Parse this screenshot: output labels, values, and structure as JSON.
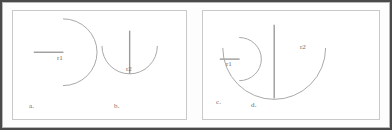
{
  "figure": {
    "panels": [
      {
        "id": "panel-left",
        "shapes": [
          {
            "key": "a",
            "caption": "a.",
            "radius_label": "r1",
            "orientation": "semicircle-opening-left",
            "radius_orientation": "horizontal",
            "size": "large"
          },
          {
            "key": "b",
            "caption": "b.",
            "radius_label": "r2",
            "orientation": "semicircle-opening-up",
            "radius_orientation": "vertical",
            "size": "medium"
          }
        ]
      },
      {
        "id": "panel-right",
        "shapes": [
          {
            "key": "c",
            "caption": "c.",
            "radius_label": "r1",
            "orientation": "semicircle-opening-left",
            "radius_orientation": "horizontal",
            "size": "small"
          },
          {
            "key": "d",
            "caption": "d.",
            "radius_label": "r2",
            "orientation": "semicircle-opening-up",
            "radius_orientation": "vertical",
            "size": "large"
          }
        ]
      }
    ]
  },
  "colors": {
    "outer_border": "#4a4a4a",
    "panel_border": "#c9c9c9",
    "arc_stroke": "#a8a8a8",
    "radius_stroke": "#9a9a9a",
    "label_text": "#6d6d6d",
    "background": "#ffffff"
  }
}
